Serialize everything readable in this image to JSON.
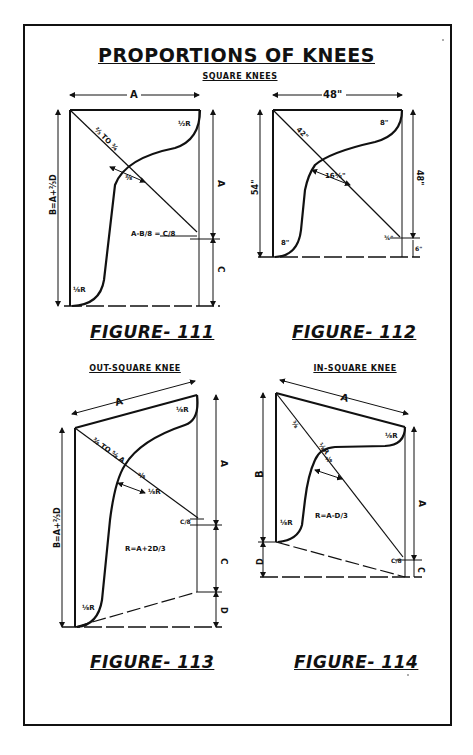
{
  "page": {
    "title": "PROPORTIONS OF KNEES",
    "sections": {
      "square": "SQUARE KNEES",
      "out_square": "OUT-SQUARE KNEE",
      "in_square": "IN-SQUARE KNEE"
    }
  },
  "figures": [
    {
      "id": "111",
      "label": "FIGURE- 111",
      "dims": {
        "top": "A",
        "left": "B = A + 2/3 D",
        "right_upper": "A",
        "right_lower": "C",
        "diag": "2/3 TO 3/4",
        "throat": "3/8",
        "corner_note": "A-B/8 = C/8",
        "radius_top": "1/2 R",
        "radius_bottom": "1/8 R"
      }
    },
    {
      "id": "112",
      "label": "FIGURE- 112",
      "dims": {
        "top": "48\"",
        "left": "54\"",
        "right_upper": "48\"",
        "right_lower": "6\"",
        "diag": "42\"",
        "throat": "16 1/2\"",
        "radius_top": "8\"",
        "radius_bottom": "8\"",
        "corner_note": "3/4\""
      }
    },
    {
      "id": "113",
      "label": "FIGURE- 113",
      "dims": {
        "top": "A",
        "left": "B = A + 2/3 D",
        "right_upper": "A",
        "right_mid": "C",
        "right_lower": "D",
        "diag": "3/8 TO 5/8 A",
        "throat": "3/8",
        "throat2": "1/8 R",
        "radius_label": "R = A+2D/3",
        "corner_note": "C/8"
      }
    },
    {
      "id": "114",
      "label": "FIGURE- 114",
      "dims": {
        "top": "A",
        "left_upper": "B",
        "left_lower": "D",
        "right_upper": "A",
        "right_lower": "C",
        "diag": "3/8",
        "throat": "1/8 R",
        "throat2": "3/8",
        "radius_label": "R = A-D/3",
        "corner_note": "C/8"
      }
    }
  ]
}
